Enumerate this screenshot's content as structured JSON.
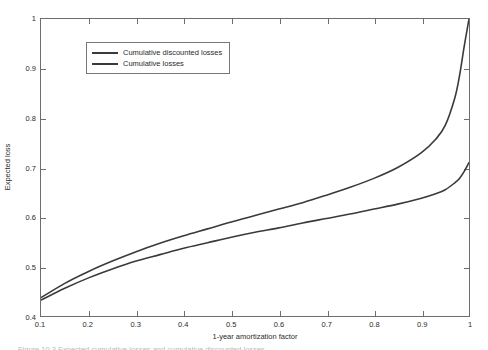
{
  "chart_data": {
    "type": "line",
    "title": "",
    "xlabel": "1-year amortization factor",
    "ylabel": "Expected loss",
    "xlim": [
      0.1,
      1.0
    ],
    "ylim": [
      0.4,
      1.0
    ],
    "grid": false,
    "legend_position": "top-left",
    "xticks": [
      "0.1",
      "0.2",
      "0.3",
      "0.4",
      "0.5",
      "0.6",
      "0.7",
      "0.8",
      "0.9",
      "1"
    ],
    "xtick_values": [
      0.1,
      0.2,
      0.3,
      0.4,
      0.5,
      0.6,
      0.7,
      0.8,
      0.9,
      1.0
    ],
    "yticks": [
      "0.4",
      "0.5",
      "0.6",
      "0.7",
      "0.8",
      "0.9",
      "1"
    ],
    "ytick_values": [
      0.4,
      0.5,
      0.6,
      0.7,
      0.8,
      0.9,
      1.0
    ],
    "x": [
      0.1,
      0.15,
      0.2,
      0.25,
      0.3,
      0.35,
      0.4,
      0.45,
      0.5,
      0.55,
      0.6,
      0.65,
      0.7,
      0.75,
      0.8,
      0.85,
      0.9,
      0.93,
      0.95,
      0.97,
      0.98,
      0.99,
      1.0
    ],
    "series": [
      {
        "name": "Cumulative discounted losses",
        "color": "#3a3a3a",
        "values": [
          0.437,
          0.466,
          0.49,
          0.511,
          0.53,
          0.547,
          0.562,
          0.576,
          0.59,
          0.603,
          0.616,
          0.629,
          0.644,
          0.66,
          0.678,
          0.7,
          0.73,
          0.757,
          0.785,
          0.84,
          0.885,
          0.945,
          1.0
        ]
      },
      {
        "name": "Cumulative losses",
        "color": "#3a3a3a",
        "values": [
          0.432,
          0.456,
          0.477,
          0.495,
          0.511,
          0.524,
          0.537,
          0.548,
          0.559,
          0.569,
          0.578,
          0.588,
          0.597,
          0.606,
          0.616,
          0.626,
          0.638,
          0.647,
          0.655,
          0.669,
          0.678,
          0.692,
          0.71
        ]
      }
    ]
  },
  "legend": {
    "entries": [
      {
        "label": "Cumulative discounted losses"
      },
      {
        "label": "Cumulative losses"
      }
    ]
  },
  "caption": {
    "sliver_text": "Figure 10.3  Expected cumulative losses and cumulative discounted losses"
  }
}
